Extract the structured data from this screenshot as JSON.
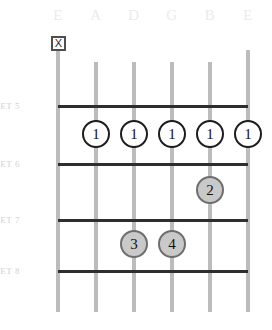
{
  "diagram": {
    "strings": [
      {
        "name": "E",
        "x": 58,
        "label": "E",
        "muted": true,
        "top": 50,
        "bottom": 312
      },
      {
        "name": "A",
        "x": 96,
        "label": "A",
        "muted": false,
        "top": 62,
        "bottom": 312
      },
      {
        "name": "D",
        "x": 134,
        "label": "D",
        "muted": false,
        "top": 62,
        "bottom": 312
      },
      {
        "name": "G",
        "x": 172,
        "label": "G",
        "muted": false,
        "top": 62,
        "bottom": 312
      },
      {
        "name": "B",
        "x": 210,
        "label": "B",
        "muted": false,
        "top": 62,
        "bottom": 312
      },
      {
        "name": "e",
        "x": 248,
        "label": "E",
        "muted": false,
        "top": 50,
        "bottom": 312
      }
    ],
    "mute_marker": {
      "glyph": "X",
      "string": "E",
      "x": 58,
      "y": 36
    },
    "frets": [
      {
        "label": "FRET 5",
        "y": 105
      },
      {
        "label": "FRET 6",
        "y": 163
      },
      {
        "label": "FRET 7",
        "y": 219
      },
      {
        "label": "FRET 8",
        "y": 270
      }
    ],
    "fret_line_left": 58,
    "fret_line_right": 248,
    "fingerings": [
      {
        "finger": "1",
        "string": "A",
        "fret": 5,
        "style": "open",
        "x": 96,
        "y": 134
      },
      {
        "finger": "1",
        "string": "D",
        "fret": 5,
        "style": "open",
        "x": 134,
        "y": 134
      },
      {
        "finger": "1",
        "string": "G",
        "fret": 5,
        "style": "open",
        "x": 172,
        "y": 134
      },
      {
        "finger": "1",
        "string": "B",
        "fret": 5,
        "style": "open",
        "x": 210,
        "y": 134
      },
      {
        "finger": "1",
        "string": "e",
        "fret": 5,
        "style": "open",
        "x": 248,
        "y": 134
      },
      {
        "finger": "2",
        "string": "B",
        "fret": 6,
        "style": "filled",
        "x": 210,
        "y": 190
      },
      {
        "finger": "3",
        "string": "D",
        "fret": 7,
        "style": "filled",
        "x": 134,
        "y": 244
      },
      {
        "finger": "4",
        "string": "G",
        "fret": 7,
        "style": "filled",
        "x": 172,
        "y": 244
      }
    ],
    "colors": {
      "string": "#bcbcbc",
      "fret": "#2e2e2e",
      "fret_label": "#d2d2d2",
      "string_label": "#ebebeb",
      "dot_open_fill": "#ffffff",
      "dot_open_border": "#1d1d1d",
      "dot_filled_fill": "#c9c9c9",
      "dot_filled_border": "#6e6e6e",
      "background": "#ffffff"
    }
  }
}
